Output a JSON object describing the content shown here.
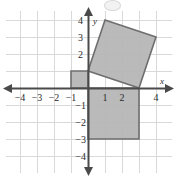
{
  "figure": {
    "type": "math-graph",
    "width": 175,
    "height": 177,
    "background_color": "#ffffff",
    "grid_color": "#d9d9d9",
    "axis_color": "#4a4a4a",
    "shape_fill_color": "#b6b6b6",
    "shape_stroke_color": "#6e6e6e",
    "label_color": "#2b2b2b"
  },
  "axes": {
    "x_axis_label": "x",
    "y_axis_label": "y",
    "origin_px": {
      "x": 88,
      "y": 88
    },
    "unit_px": 17,
    "x_range": [
      -4.7,
      4.7
    ],
    "y_range": [
      -4.7,
      4.7
    ],
    "x_tick_labels": [
      {
        "value": -4,
        "text": "−4"
      },
      {
        "value": -3,
        "text": "−3"
      },
      {
        "value": -2,
        "text": "−2"
      },
      {
        "value": -1,
        "text": "−1"
      },
      {
        "value": 1,
        "text": "1"
      },
      {
        "value": 2,
        "text": "2"
      },
      {
        "value": 4,
        "text": "4"
      }
    ],
    "y_tick_labels": [
      {
        "value": 4,
        "text": "4"
      },
      {
        "value": 3,
        "text": "3"
      },
      {
        "value": 2,
        "text": "2"
      },
      {
        "value": -1,
        "text": "−1"
      },
      {
        "value": -2,
        "text": "−2"
      },
      {
        "value": -3,
        "text": "−3"
      },
      {
        "value": -4,
        "text": "−4"
      }
    ],
    "arrows": [
      "left",
      "right",
      "up",
      "down"
    ]
  },
  "chart_data": {
    "type": "scatter",
    "title": "",
    "xlabel": "x",
    "ylabel": "y",
    "xlim": [
      -4.7,
      4.7
    ],
    "ylim": [
      -4.7,
      4.7
    ],
    "grid": true,
    "legend": "none",
    "shapes": [
      {
        "name": "rotated-square",
        "kind": "polygon",
        "vertices": [
          [
            0,
            1
          ],
          [
            1,
            4
          ],
          [
            4,
            3
          ],
          [
            3,
            0
          ]
        ],
        "fill": "#b6b6b6",
        "stroke": "#6e6e6e"
      },
      {
        "name": "lower-rectangle",
        "kind": "polygon",
        "vertices": [
          [
            0,
            0
          ],
          [
            3,
            0
          ],
          [
            3,
            -3
          ],
          [
            0,
            -3
          ]
        ],
        "fill": "#b6b6b6",
        "stroke": "#6e6e6e"
      },
      {
        "name": "small-square",
        "kind": "polygon",
        "vertices": [
          [
            -1,
            0
          ],
          [
            0,
            0
          ],
          [
            0,
            1
          ],
          [
            -1,
            1
          ]
        ],
        "fill": "#b6b6b6",
        "stroke": "#6e6e6e"
      }
    ]
  },
  "page_artifacts": {
    "top_left_text": "",
    "top_right_text": "",
    "top_center_icon": "circle-icon"
  }
}
